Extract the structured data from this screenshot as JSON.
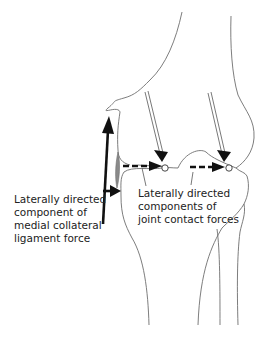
{
  "diagram": {
    "labels": {
      "mcl": {
        "lines": [
          "Laterally directed",
          "component of",
          "medial collateral",
          "ligament force"
        ]
      },
      "contact": {
        "lines": [
          "Laterally directed",
          "components of",
          "joint contact forces"
        ]
      }
    },
    "colors": {
      "outline": "#6e6e6e",
      "arrow": "#111111",
      "ligament": "#8a8a8a",
      "text": "#222222"
    }
  }
}
